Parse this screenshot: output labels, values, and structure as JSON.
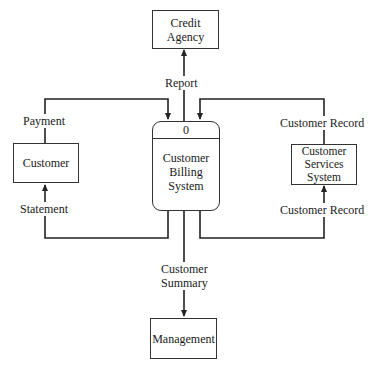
{
  "diagram": {
    "type": "data-flow-diagram (context level)",
    "process": {
      "id": "0",
      "name": "Customer\nBilling\nSystem"
    },
    "entities": [
      {
        "key": "credit_agency",
        "name": "Credit\nAgency"
      },
      {
        "key": "customer",
        "name": "Customer"
      },
      {
        "key": "customer_services",
        "name": "Customer\nServices\nSystem"
      },
      {
        "key": "management",
        "name": "Management"
      }
    ],
    "flows": [
      {
        "key": "report",
        "label": "Report",
        "from": "Customer Billing System",
        "to": "Credit Agency"
      },
      {
        "key": "payment",
        "label": "Payment",
        "from": "Customer",
        "to": "Customer Billing System"
      },
      {
        "key": "statement",
        "label": "Statement",
        "from": "Customer Billing System",
        "to": "Customer"
      },
      {
        "key": "record_in",
        "label": "Customer Record",
        "from": "Customer Services System",
        "to": "Customer Billing System"
      },
      {
        "key": "record_out",
        "label": "Customer Record",
        "from": "Customer Billing System",
        "to": "Customer Services System"
      },
      {
        "key": "summary",
        "label": "Customer\nSummary",
        "from": "Customer Billing System",
        "to": "Management"
      }
    ]
  },
  "labels": {
    "process_id": "0",
    "process_name": "Customer\nBilling\nSystem",
    "credit_agency": "Credit\nAgency",
    "customer": "Customer",
    "customer_services": "Customer\nServices\nSystem",
    "management": "Management",
    "report": "Report",
    "payment": "Payment",
    "statement": "Statement",
    "record_top": "Customer Record",
    "record_bottom": "Customer Record",
    "summary": "Customer\nSummary"
  }
}
